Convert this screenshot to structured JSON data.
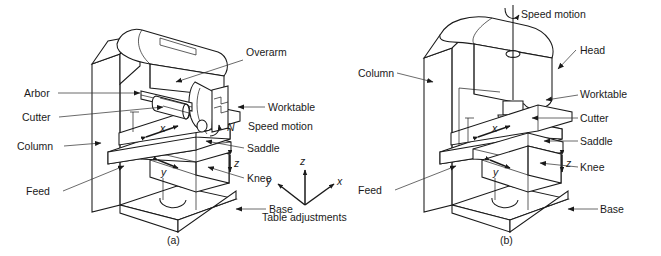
{
  "figure": {
    "background": "#ffffff",
    "line_color": "#1a1a1a"
  },
  "panel_a": {
    "caption": "(a)",
    "type": "horizontal-milling-machine",
    "labels": {
      "arbor": "Arbor",
      "cutter": "Cutter",
      "column": "Column",
      "feed": "Feed",
      "overarm": "Overarm",
      "worktable": "Worktable",
      "speed_motion": "Speed motion",
      "saddle": "Saddle",
      "knee": "Knee",
      "base": "Base"
    },
    "motion_symbols": {
      "x": "x",
      "y": "y",
      "z": "z",
      "rotation": "N"
    }
  },
  "panel_b": {
    "caption": "(b)",
    "type": "vertical-milling-machine",
    "labels": {
      "speed_motion": "Speed motion",
      "head": "Head",
      "column": "Column",
      "worktable": "Worktable",
      "cutter": "Cutter",
      "saddle": "Saddle",
      "knee": "Knee",
      "feed": "Feed",
      "base": "Base"
    },
    "motion_symbols": {
      "x": "x",
      "y": "y",
      "z": "z"
    }
  },
  "axes_legend": {
    "caption": "Table adjustments",
    "axis_x": "x",
    "axis_y": "y",
    "axis_z": "z"
  }
}
